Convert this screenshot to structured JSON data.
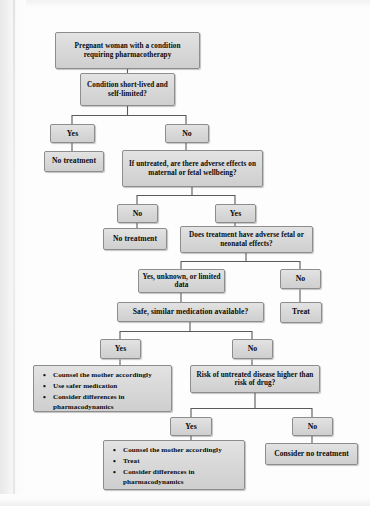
{
  "figure": {
    "type": "flowchart",
    "colors": {
      "node_fill": "#d9d9d9",
      "node_border": "#8d8d8d",
      "connector": "#5a5a5a",
      "text": "#0a0a0a",
      "page_background": "#fdfdfd"
    }
  },
  "nodes": {
    "start": "Pregnant woman with a condition requiring pharmacotherapy",
    "q_short_lived": "Condition short-lived and self-limited?",
    "short_lived_yes": "Yes",
    "short_lived_no": "No",
    "no_treatment_1": "No treatment",
    "q_untreated_adverse": "If untreated, are there adverse effects on maternal or fetal wellbeing?",
    "untreated_no": "No",
    "untreated_yes": "Yes",
    "no_treatment_2": "No treatment",
    "q_treatment_adverse": "Does treatment have adverse fetal or neonatal effects?",
    "treatment_yes_unknown": "Yes, unknown, or limited data",
    "treatment_no": "No",
    "treat_1": "Treat",
    "q_safe_similar": "Safe, similar medication available?",
    "safe_yes": "Yes",
    "safe_no": "No",
    "outcome_safer_medication": {
      "bullets": [
        "Counsel the mother accordingly",
        "Use safer medication",
        "Consider differences in pharmacodynamics"
      ]
    },
    "q_risk_higher": "Risk of untreated disease higher than risk of drug?",
    "risk_yes": "Yes",
    "risk_no": "No",
    "outcome_treat": {
      "bullets": [
        "Counsel the mother accordingly",
        "Treat",
        "Consider differences in pharmacodynamics"
      ]
    },
    "consider_no_treatment": "Consider no treatment"
  }
}
